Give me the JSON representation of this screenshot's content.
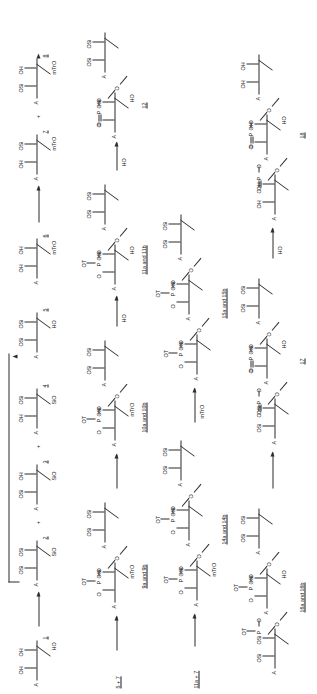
{
  "scheme": {
    "title": "Oligonucleotide block synthesis scheme",
    "glyphs": {
      "base": "A",
      "hydroxyl": "OH",
      "hydroxyl_rev": "HO",
      "silyl": "OSi",
      "silyl_rev": "SiO",
      "trityl": "mTrO",
      "triazole": "OT",
      "oxygen": "O",
      "phosphorus": "P",
      "phospho_oxo": "O",
      "plus": "+",
      "and": "and"
    },
    "rows": [
      {
        "id": "row-1",
        "steps": [
          {
            "type": "compound",
            "number": "1",
            "base": "A",
            "top_left": "OH",
            "top_right": "OH",
            "bottom": "HO"
          },
          {
            "type": "arrow"
          },
          {
            "type": "compound",
            "number": "2",
            "base": "A",
            "top_left": "OSi",
            "top_right": "OSi",
            "bottom": "SiO"
          },
          {
            "type": "plus",
            "label": "+"
          },
          {
            "type": "compound",
            "number": "3",
            "base": "A",
            "top_left": "OSi",
            "top_right": "OH",
            "bottom": "SiO"
          },
          {
            "type": "plus",
            "label": "+"
          },
          {
            "type": "compound",
            "number": "4",
            "base": "A",
            "top_left": "OH",
            "top_right": "OSi",
            "bottom": "SiO"
          },
          {
            "type": "compound",
            "number": "5",
            "base": "A",
            "top_left": "OSi",
            "top_right": "OSi",
            "bottom": "HO"
          },
          {
            "type": "compound",
            "number": "6",
            "base": "A",
            "top_left": "OH",
            "top_right": "OH",
            "bottom": "mTrO"
          },
          {
            "type": "arrow"
          },
          {
            "type": "compound",
            "number": "7",
            "base": "A",
            "top_left": "OH",
            "top_right": "OSi",
            "bottom": "mTrO"
          },
          {
            "type": "plus",
            "label": "+"
          },
          {
            "type": "compound",
            "number": "8",
            "base": "A",
            "top_left": "OSi",
            "top_right": "OH",
            "bottom": "mTrO"
          }
        ],
        "loop_note": "2 recycled to 5"
      },
      {
        "id": "row-2",
        "start_label": "5 + 7",
        "steps": [
          {
            "type": "arrow"
          },
          {
            "type": "dimer",
            "label": "9a and 9b",
            "left_unit": {
              "base": "A",
              "top_left": "",
              "top_right": "OSi",
              "bottom": "mTrO"
            },
            "right_unit": {
              "base": "A",
              "top_left": "OSi",
              "top_right": "OSi",
              "bottom": ""
            },
            "phosphate": {
              "top": "OT",
              "left": "O",
              "right": "O",
              "center": "P"
            }
          },
          {
            "type": "arrow"
          },
          {
            "type": "dimer",
            "label": "10a and 10b",
            "left_unit": {
              "base": "A",
              "top_left": "",
              "top_right": "OSi",
              "bottom": "mTrO"
            },
            "right_unit": {
              "base": "A",
              "top_left": "OSi",
              "top_right": "OSi",
              "bottom": ""
            },
            "phosphate": {
              "top": "OT",
              "left": "O",
              "right": "O",
              "center": "P"
            }
          },
          {
            "type": "arrow",
            "reagent": "HO"
          },
          {
            "type": "dimer",
            "label": "11a and 11b",
            "left_unit": {
              "base": "A",
              "top_left": "",
              "top_right": "OSi",
              "bottom": "HO"
            },
            "right_unit": {
              "base": "A",
              "top_left": "OSi",
              "top_right": "OSi",
              "bottom": ""
            },
            "phosphate": {
              "top": "OT",
              "left": "O",
              "right": "O",
              "center": "P"
            }
          },
          {
            "type": "arrow",
            "reagent": "HO"
          },
          {
            "type": "dimer",
            "label": "12",
            "left_unit": {
              "base": "A",
              "top_left": "",
              "top_right": "OSi",
              "bottom": "HO"
            },
            "right_unit": {
              "base": "A",
              "top_left": "OSi",
              "top_right": "OSi",
              "bottom": ""
            },
            "phosphate": {
              "top": "O",
              "left": "O",
              "right": "O",
              "center": "P",
              "double": true
            }
          },
          {
            "type": "arrow",
            "reagent": "HO"
          },
          {
            "type": "dimer",
            "label": "13",
            "left_unit": {
              "base": "A",
              "top_left": "",
              "top_right": "OH",
              "bottom": "HO"
            },
            "right_unit": {
              "base": "A",
              "top_left": "OH",
              "top_right": "OH",
              "bottom": ""
            },
            "phosphate": {
              "top": "O",
              "left": "O",
              "right": "O",
              "center": "P",
              "double": true
            }
          }
        ]
      },
      {
        "id": "row-3",
        "start_label": "11a + 7",
        "steps": [
          {
            "type": "arrow"
          },
          {
            "type": "trimer",
            "label": "14a and 14b",
            "units": [
              {
                "base": "A",
                "top_left": "",
                "top_right": "OSi",
                "bottom": "mTrO"
              },
              {
                "base": "A",
                "top_left": "",
                "top_right": "OSi",
                "bottom": ""
              },
              {
                "base": "A",
                "top_left": "OSi",
                "top_right": "OSi",
                "bottom": ""
              }
            ],
            "phosphates": [
              {
                "top": "OT",
                "left": "O",
                "right": "O",
                "center": "P"
              },
              {
                "top": "OT",
                "left": "O",
                "right": "O",
                "center": "P"
              }
            ]
          },
          {
            "type": "arrow",
            "reagent": "mTrO"
          },
          {
            "type": "trimer",
            "label": "15a and 15b",
            "units": [
              {
                "base": "A",
                "top_left": "",
                "top_right": "OSi",
                "bottom": ""
              },
              {
                "base": "A",
                "top_left": "",
                "top_right": "OSi",
                "bottom": ""
              },
              {
                "base": "A",
                "top_left": "OSi",
                "top_right": "OSi",
                "bottom": ""
              }
            ],
            "phosphates": [
              {
                "top": "OT",
                "left": "O",
                "right": "O",
                "center": "P"
              },
              {
                "top": "OT",
                "left": "O",
                "right": "O",
                "center": "P"
              }
            ]
          }
        ]
      },
      {
        "id": "row-4",
        "steps": [
          {
            "type": "trimer",
            "label": "16a and 16b",
            "units": [
              {
                "base": "A",
                "top_left": "",
                "top_right": "OSi",
                "bottom": ""
              },
              {
                "base": "A",
                "top_left": "",
                "top_right": "OSi",
                "bottom": "HO"
              },
              {
                "base": "A",
                "top_left": "OSi",
                "top_right": "OSi",
                "bottom": ""
              }
            ],
            "phosphates": [
              {
                "top": "OT",
                "left": "O",
                "right": "O",
                "center": "P"
              },
              {
                "top": "OT",
                "left": "O",
                "right": "O",
                "center": "P"
              }
            ]
          },
          {
            "type": "arrow"
          },
          {
            "type": "trimer",
            "label": "17",
            "units": [
              {
                "base": "A",
                "top_left": "",
                "top_right": "OSi",
                "bottom": "HO"
              },
              {
                "base": "A",
                "top_left": "",
                "top_right": "OSi",
                "bottom": ""
              },
              {
                "base": "A",
                "top_left": "OSi",
                "top_right": "OSi",
                "bottom": ""
              }
            ],
            "phosphates": [
              {
                "top": "O",
                "left": "O",
                "right": "O",
                "center": "P",
                "double": true
              },
              {
                "top": "O",
                "left": "O",
                "right": "O",
                "center": "P",
                "double": true
              }
            ]
          },
          {
            "type": "arrow",
            "reagent": "HO"
          },
          {
            "type": "trimer",
            "label": "18",
            "units": [
              {
                "base": "A",
                "top_left": "",
                "top_right": "OH",
                "bottom": "HO"
              },
              {
                "base": "A",
                "top_left": "",
                "top_right": "OH",
                "bottom": ""
              },
              {
                "base": "A",
                "top_left": "OH",
                "top_right": "OH",
                "bottom": ""
              }
            ],
            "phosphates": [
              {
                "top": "O",
                "left": "O",
                "right": "O",
                "center": "P",
                "double": true
              },
              {
                "top": "O",
                "left": "O",
                "right": "O",
                "center": "P",
                "double": true
              }
            ]
          }
        ]
      }
    ]
  },
  "labels": {
    "c1": "1",
    "c2": "2",
    "c3": "3",
    "c4": "4",
    "c5": "5",
    "c6": "6",
    "c7": "7",
    "c8": "8",
    "c9": "9a and 9b",
    "c10": "10a and 10b",
    "c11": "11a and 11b",
    "c12": "12",
    "c13": "13",
    "c14": "14a and 14b",
    "c15": "15a and 15b",
    "c16": "16a and 16b",
    "c17": "17",
    "c18": "18",
    "start_row2": "5 + 7",
    "start_row3": "11a + 7",
    "plus": "+",
    "A": "A",
    "OH": "OH",
    "HO": "HO",
    "OSi": "OSi",
    "SiO": "SiO",
    "mTrO": "mTrO",
    "OT": "OT",
    "O": "O",
    "P": "P"
  }
}
